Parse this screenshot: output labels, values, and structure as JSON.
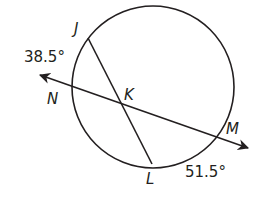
{
  "diagram": {
    "type": "circle-secants",
    "circle": {
      "cx": 153,
      "cy": 87,
      "r": 81
    },
    "points": {
      "J": {
        "label": "J",
        "x": 88,
        "y": 38
      },
      "N": {
        "label": "N",
        "x": 72,
        "y": 87
      },
      "K": {
        "label": "K",
        "x": 123,
        "y": 103
      },
      "L": {
        "label": "L",
        "x": 152,
        "y": 164
      },
      "M": {
        "label": "M",
        "x": 217,
        "y": 135
      }
    },
    "arcs": {
      "JN": {
        "label": "38.5°"
      },
      "LM": {
        "label": "51.5°"
      }
    },
    "line_NM": {
      "arrow_left": {
        "x": 38,
        "y": 75
      },
      "arrow_right": {
        "x": 250,
        "y": 148
      }
    },
    "colors": {
      "stroke": "#231f20",
      "background": "#ffffff"
    }
  }
}
